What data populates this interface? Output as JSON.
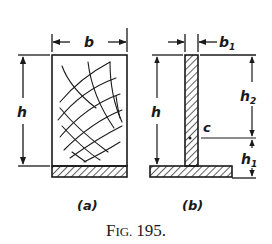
{
  "figure": {
    "caption": "Fig. 195.",
    "caption_fig": "F",
    "caption_ig": "IG.",
    "caption_num": "195."
  },
  "diagram_a": {
    "sublabel": "(a)",
    "width_label": "b",
    "height_label": "h",
    "description": "Rectangular section with crosshatched curved grid over a hatched base strip"
  },
  "diagram_b": {
    "sublabel": "(b)",
    "web_width_label": "b",
    "web_width_subscript": "1",
    "height_label": "h",
    "upper_height_label": "h",
    "upper_height_subscript": "2",
    "lower_height_label": "h",
    "lower_height_subscript": "1",
    "centroid_label": "c",
    "description": "Inverted T-section: narrow hatched web on hatched flange"
  },
  "colors": {
    "ink": "#1a1a1a",
    "background": "#ffffff"
  }
}
